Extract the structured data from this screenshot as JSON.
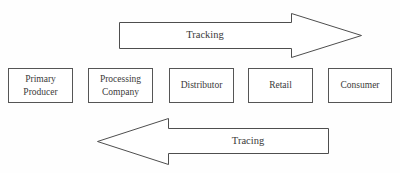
{
  "diagram": {
    "background_color": "#fefefe",
    "line_color": "#555555",
    "text_color": "#3a3a3a",
    "stages": [
      {
        "id": "primary-producer",
        "lines": [
          "Primary",
          "Producer"
        ],
        "x": 8,
        "y": 68,
        "width": 65,
        "height": 35
      },
      {
        "id": "processing-company",
        "lines": [
          "Processing",
          "Company"
        ],
        "x": 88,
        "y": 68,
        "width": 65,
        "height": 35
      },
      {
        "id": "distributor",
        "lines": [
          "Distributor"
        ],
        "x": 169,
        "y": 68,
        "width": 65,
        "height": 35
      },
      {
        "id": "retail",
        "lines": [
          "Retail"
        ],
        "x": 248,
        "y": 68,
        "width": 65,
        "height": 35
      },
      {
        "id": "consumer",
        "lines": [
          "Consumer"
        ],
        "x": 328,
        "y": 68,
        "width": 64,
        "height": 35
      }
    ],
    "arrows": [
      {
        "id": "tracking-arrow",
        "label": "Tracking",
        "direction": "right",
        "points": "119.5,22.5 291.5,22.5 291.5,13.5 361.5,35.5 291.5,57.5 291.5,48.5 119.5,48.5",
        "label_left": 119,
        "label_top": 29,
        "label_width": 172
      },
      {
        "id": "tracing-arrow",
        "label": "Tracing",
        "direction": "left",
        "points": "328.5,128.5 168.5,128.5 168.5,118.5 97.5,141.5 168.5,164.5 168.5,153.5 328.5,153.5",
        "label_left": 168,
        "label_top": 135,
        "label_width": 160
      }
    ]
  }
}
